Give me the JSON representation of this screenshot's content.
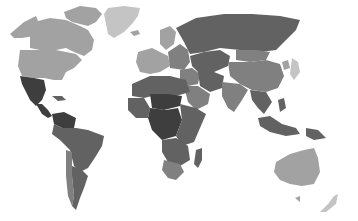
{
  "map": {
    "type": "choropleth-world-map",
    "style": "grayscale",
    "background_color": "#ffffff",
    "shade_levels": {
      "lightest": "#c4c4c4",
      "light": "#a2a2a2",
      "medium": "#808080",
      "dark": "#626262",
      "darkest": "#3e3e3e"
    },
    "regions": [
      {
        "name": "Greenland",
        "shade": "lightest"
      },
      {
        "name": "Alaska",
        "shade": "light"
      },
      {
        "name": "Canada",
        "shade": "light"
      },
      {
        "name": "Arctic Islands",
        "shade": "light"
      },
      {
        "name": "United States",
        "shade": "light"
      },
      {
        "name": "Mexico",
        "shade": "darkest"
      },
      {
        "name": "Central America",
        "shade": "darkest"
      },
      {
        "name": "Caribbean",
        "shade": "dark"
      },
      {
        "name": "Colombia & Venezuela",
        "shade": "darkest"
      },
      {
        "name": "South America",
        "shade": "dark"
      },
      {
        "name": "Chile",
        "shade": "medium"
      },
      {
        "name": "Argentina",
        "shade": "dark"
      },
      {
        "name": "Iceland",
        "shade": "light"
      },
      {
        "name": "Scandinavia",
        "shade": "light"
      },
      {
        "name": "Western Europe",
        "shade": "light"
      },
      {
        "name": "Eastern Europe",
        "shade": "medium"
      },
      {
        "name": "Russia",
        "shade": "dark"
      },
      {
        "name": "Central Asia",
        "shade": "dark"
      },
      {
        "name": "Middle East",
        "shade": "medium"
      },
      {
        "name": "Arabian Peninsula",
        "shade": "medium"
      },
      {
        "name": "Iran & Afghanistan",
        "shade": "dark"
      },
      {
        "name": "China",
        "shade": "medium"
      },
      {
        "name": "Mongolia",
        "shade": "medium"
      },
      {
        "name": "India",
        "shade": "medium"
      },
      {
        "name": "Southeast Asia",
        "shade": "dark"
      },
      {
        "name": "Japan",
        "shade": "lightest"
      },
      {
        "name": "Korea",
        "shade": "light"
      },
      {
        "name": "Indonesia",
        "shade": "dark"
      },
      {
        "name": "Philippines",
        "shade": "dark"
      },
      {
        "name": "Papua New Guinea",
        "shade": "dark"
      },
      {
        "name": "North Africa",
        "shade": "dark"
      },
      {
        "name": "Sahel",
        "shade": "darkest"
      },
      {
        "name": "West Africa",
        "shade": "dark"
      },
      {
        "name": "Central Africa",
        "shade": "darkest"
      },
      {
        "name": "East Africa",
        "shade": "dark"
      },
      {
        "name": "Southern Africa",
        "shade": "dark"
      },
      {
        "name": "South Africa",
        "shade": "medium"
      },
      {
        "name": "Madagascar",
        "shade": "dark"
      },
      {
        "name": "Australia",
        "shade": "light"
      },
      {
        "name": "Tasmania",
        "shade": "light"
      },
      {
        "name": "New Zealand",
        "shade": "lightest"
      }
    ]
  }
}
